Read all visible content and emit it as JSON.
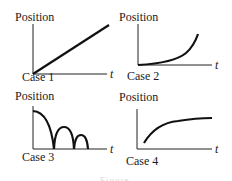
{
  "panels": [
    {
      "ylabel": "Position",
      "xlabel": "t",
      "caption": "Case 1",
      "shape": "linear increasing"
    },
    {
      "ylabel": "Position",
      "xlabel": "t",
      "caption": "Case 2",
      "shape": "increasing, concave up"
    },
    {
      "ylabel": "Position",
      "xlabel": "t",
      "caption": "Case 3",
      "shape": "decreasing bounces"
    },
    {
      "ylabel": "Position",
      "xlabel": "t",
      "caption": "Case 4",
      "shape": "increasing, concave down"
    }
  ],
  "figure_caption": "Figure ..."
}
